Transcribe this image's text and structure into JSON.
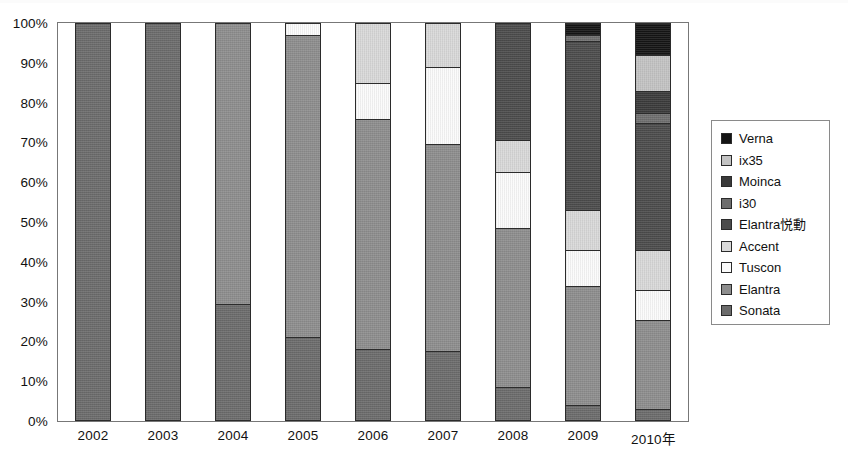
{
  "chart_data": {
    "type": "bar",
    "subtype": "stacked-percentage",
    "title": "",
    "xlabel": "",
    "ylabel": "",
    "ylim": [
      0,
      100
    ],
    "ytick_labels": [
      "0%",
      "10%",
      "20%",
      "30%",
      "40%",
      "50%",
      "60%",
      "70%",
      "80%",
      "90%",
      "100%"
    ],
    "ytick_values": [
      0,
      10,
      20,
      30,
      40,
      50,
      60,
      70,
      80,
      90,
      100
    ],
    "grid": false,
    "legend_position": "right",
    "categories": [
      "2002",
      "2003",
      "2004",
      "2005",
      "2006",
      "2007",
      "2008",
      "2009",
      "2010年"
    ],
    "series": [
      {
        "name": "Verna",
        "color": "#141414",
        "values": [
          0,
          0,
          0,
          0,
          0,
          0,
          0,
          3.0,
          8.0
        ]
      },
      {
        "name": "ix35",
        "color": "#c3c3c3",
        "values": [
          0,
          0,
          0,
          0,
          0,
          0,
          0,
          0,
          9.0
        ]
      },
      {
        "name": "Moinca",
        "color": "#3a3a3a",
        "values": [
          0,
          0,
          0,
          0,
          0,
          0,
          0,
          0,
          5.5
        ]
      },
      {
        "name": "i30",
        "color": "#6e6e6e",
        "values": [
          0,
          0,
          0,
          0,
          0,
          0,
          0,
          1.5,
          2.5
        ]
      },
      {
        "name": "Elantra悦動",
        "color": "#4b4b4b",
        "values": [
          0,
          0,
          0,
          0,
          0,
          0,
          29.5,
          42.5,
          32.0
        ]
      },
      {
        "name": "Accent",
        "color": "#d9d9d9",
        "values": [
          0,
          0,
          0,
          0,
          15.0,
          11.0,
          8.0,
          10.0,
          10.0
        ]
      },
      {
        "name": "Tuscon",
        "color": "#fbfbfb",
        "values": [
          0,
          0,
          0,
          3.0,
          9.0,
          19.5,
          14.0,
          9.0,
          7.5
        ]
      },
      {
        "name": "Elantra",
        "color": "#8d8d8d",
        "values": [
          0,
          0,
          70.5,
          76.0,
          58.0,
          52.0,
          40.0,
          30.0,
          22.5
        ]
      },
      {
        "name": "Sonata",
        "color": "#6b6b6b",
        "values": [
          100,
          100,
          29.5,
          21.0,
          18.0,
          17.5,
          8.5,
          4.0,
          3.0
        ]
      }
    ],
    "stack_order_bottom_to_top": [
      "Sonata",
      "Elantra",
      "Tuscon",
      "Accent",
      "Elantra悦動",
      "i30",
      "Moinca",
      "ix35",
      "Verna"
    ]
  },
  "legend": {
    "items": [
      {
        "label": "Verna",
        "swatch": "#141414"
      },
      {
        "label": "ix35",
        "swatch": "#c3c3c3"
      },
      {
        "label": "Moinca",
        "swatch": "#3a3a3a"
      },
      {
        "label": "i30",
        "swatch": "#6e6e6e"
      },
      {
        "label": "Elantra悦動",
        "swatch": "#4b4b4b"
      },
      {
        "label": "Accent",
        "swatch": "#d9d9d9"
      },
      {
        "label": "Tuscon",
        "swatch": "#fbfbfb"
      },
      {
        "label": "Elantra",
        "swatch": "#8d8d8d"
      },
      {
        "label": "Sonata",
        "swatch": "#6b6b6b"
      }
    ]
  },
  "caption": {
    "text": ""
  }
}
